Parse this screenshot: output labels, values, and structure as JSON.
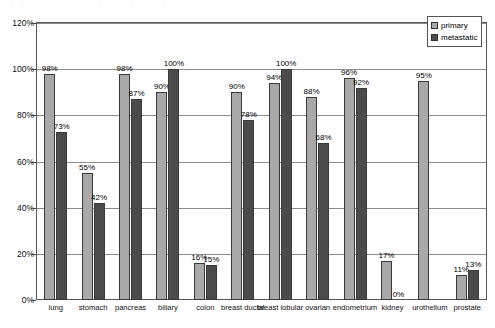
{
  "top_strip_text": "· · · · · · · · · · · · · · · · · · · ·",
  "legend": {
    "position": "top-right",
    "items": [
      {
        "label": "primary",
        "color": "#a9a9a9"
      },
      {
        "label": "metastatic",
        "color": "#4b4b4b"
      }
    ]
  },
  "axis": {
    "y_ticks": [
      "0%",
      "20%",
      "40%",
      "60%",
      "80%",
      "100%",
      "120%"
    ]
  },
  "chart_data": {
    "type": "bar",
    "title": "",
    "xlabel": "",
    "ylabel": "",
    "ylim": [
      0,
      120
    ],
    "grid": true,
    "legend_position": "top-right",
    "value_label_suffix": "%",
    "categories": [
      "lung",
      "stomach",
      "pancreas",
      "biliary",
      "colon",
      "breast ductal",
      "breast lobular",
      "ovarian",
      "endometrium",
      "kidney",
      "urothelium",
      "prostate"
    ],
    "series": [
      {
        "name": "primary",
        "color": "#a9a9a9",
        "values": [
          98,
          55,
          98,
          90,
          16,
          90,
          94,
          88,
          96,
          17,
          95,
          11
        ],
        "labels": [
          "98%",
          "55%",
          "98%",
          "90%",
          "16%",
          "90%",
          "94%",
          "88%",
          "96%",
          "17%",
          "95%",
          "11%"
        ]
      },
      {
        "name": "metastatic",
        "color": "#4b4b4b",
        "values": [
          73,
          42,
          87,
          100,
          15,
          78,
          100,
          68,
          92,
          0,
          null,
          13
        ],
        "labels": [
          "73%",
          "42%",
          "87%",
          "100%",
          "15%",
          "78%",
          "100%",
          "68%",
          "92%",
          "0%",
          "",
          "13%"
        ]
      }
    ]
  }
}
